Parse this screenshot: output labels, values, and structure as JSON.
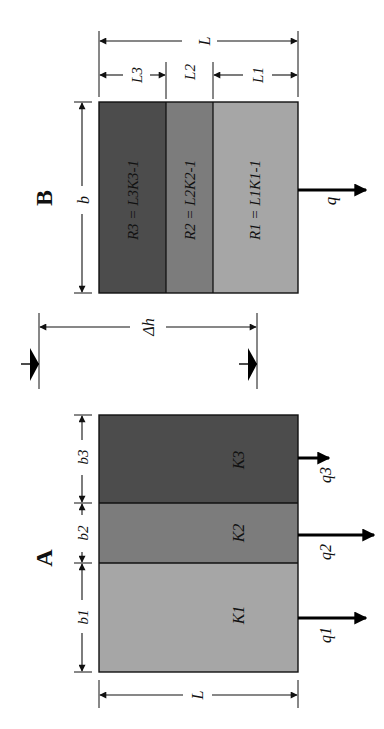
{
  "figure": {
    "orientation": "rotated 90 degrees clockwise",
    "panel_b": {
      "heading": "B",
      "width_label": "b",
      "total_length_label": "L",
      "layers": [
        {
          "name": "layer-3",
          "length_label": "L3",
          "resistance_label": "R3 = L3K3-1",
          "color": "#4c4c4c"
        },
        {
          "name": "layer-2",
          "length_label": "L2",
          "resistance_label": "R2 = L2K2-1",
          "color": "#7c7c7c"
        },
        {
          "name": "layer-1",
          "length_label": "L1",
          "resistance_label": "R1 = L1K1-1",
          "color": "#a6a6a6"
        }
      ],
      "flow_label": "q"
    },
    "head_difference": {
      "label": "Δh"
    },
    "panel_a": {
      "heading": "A",
      "length_label": "L",
      "layers": [
        {
          "name": "layer-3",
          "width_label": "b3",
          "conductivity_label": "K3",
          "flow_label": "q3",
          "color": "#4c4c4c"
        },
        {
          "name": "layer-2",
          "width_label": "b2",
          "conductivity_label": "K2",
          "flow_label": "q2",
          "color": "#7c7c7c"
        },
        {
          "name": "layer-1",
          "width_label": "b1",
          "conductivity_label": "K1",
          "flow_label": "q1",
          "color": "#a6a6a6"
        }
      ]
    },
    "colors": {
      "ink": "#111111",
      "dark_layer": "#4c4c4c",
      "mid_layer": "#7c7c7c",
      "light_layer": "#a6a6a6"
    }
  }
}
